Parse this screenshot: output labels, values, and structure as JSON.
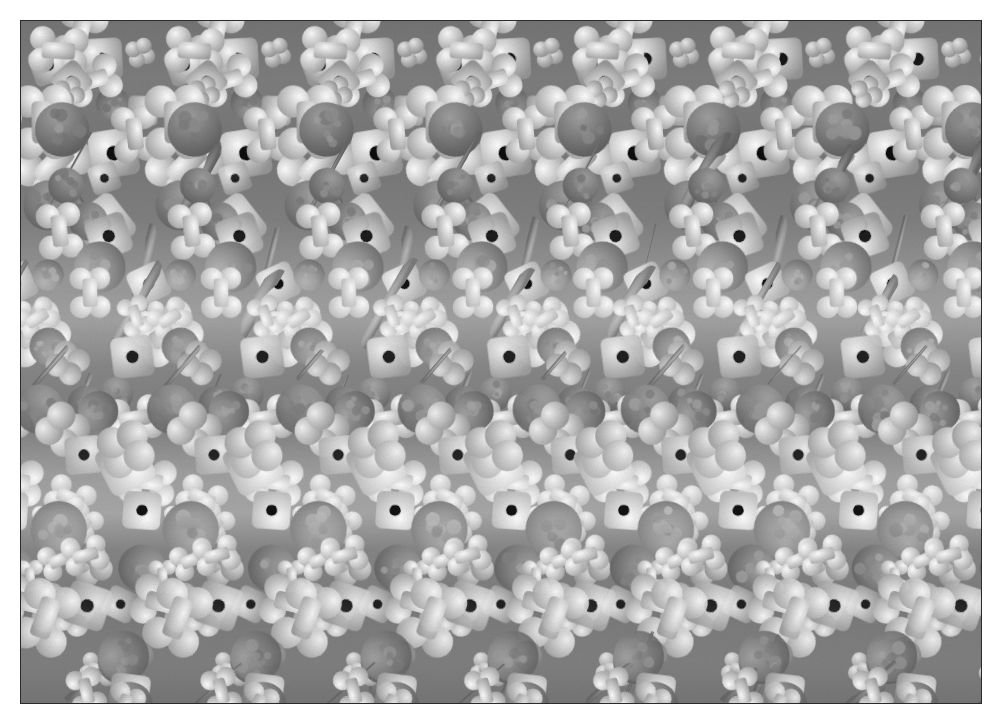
{
  "image": {
    "title": "Autostereogram",
    "kind": "single-image-random-dot-stereogram",
    "canvas_width": 1003,
    "canvas_height": 725,
    "margin_color": "#ffffff",
    "plate": {
      "x": 21,
      "y": 21,
      "width": 960,
      "height": 682,
      "border_color": "#2b2b2b",
      "colorspace": "grayscale"
    },
    "tiling": {
      "repeat_axis": "horizontal",
      "base_period_px": 120,
      "repeats_across": 8,
      "period_min_px": 108,
      "period_max_px": 136,
      "cell_height_px": 46,
      "rows": 16
    },
    "palette": {
      "black": "#0d0d0d",
      "shadow": "#3a3a3a",
      "dark_gray": "#5e5e5e",
      "mid_gray": "#868686",
      "ball_gray": "#909090",
      "rod_gray": "#9c9c9c",
      "light_gray": "#c8c8c8",
      "near_white": "#ececec",
      "white": "#f7f7f7",
      "background": "#7a7a7a"
    },
    "motifs": [
      {
        "name": "bone",
        "label": "dog-bone shape",
        "fill": "#f4f4f4",
        "weight": 30
      },
      {
        "name": "square-hole",
        "label": "square tile with hole",
        "fill": "#e4e4e4",
        "weight": 18
      },
      {
        "name": "ball",
        "label": "round kibble ball",
        "fill": "#8e8e8e",
        "weight": 26
      },
      {
        "name": "rod",
        "label": "curved rod / tube",
        "fill": "#9a9a9a",
        "weight": 16
      },
      {
        "name": "clover",
        "label": "clover / lobed blob",
        "fill": "#d8d8d8",
        "weight": 10
      }
    ],
    "brightness_bands": [
      {
        "y": 0,
        "level": 0.46
      },
      {
        "y": 60,
        "level": 0.52
      },
      {
        "y": 130,
        "level": 0.48
      },
      {
        "y": 200,
        "level": 0.54
      },
      {
        "y": 262,
        "level": 0.74
      },
      {
        "y": 300,
        "level": 0.8
      },
      {
        "y": 345,
        "level": 0.6
      },
      {
        "y": 400,
        "level": 0.52
      },
      {
        "y": 452,
        "level": 0.78
      },
      {
        "y": 492,
        "level": 0.84
      },
      {
        "y": 530,
        "level": 0.58
      },
      {
        "y": 590,
        "level": 0.5
      },
      {
        "y": 640,
        "level": 0.54
      },
      {
        "y": 682,
        "level": 0.47
      }
    ],
    "depth_map": {
      "description": "horizontal period modulation encoding the hidden 3-D relief",
      "rows": [
        [
          0,
          0,
          0,
          0,
          0,
          0,
          0,
          0,
          0,
          0,
          0,
          0
        ],
        [
          0,
          0,
          1,
          1,
          1,
          1,
          1,
          1,
          1,
          1,
          0,
          0
        ],
        [
          0,
          1,
          1,
          2,
          2,
          2,
          2,
          2,
          2,
          1,
          1,
          0
        ],
        [
          0,
          1,
          2,
          2,
          3,
          3,
          3,
          3,
          2,
          2,
          1,
          0
        ],
        [
          0,
          1,
          2,
          3,
          3,
          4,
          4,
          3,
          3,
          2,
          1,
          0
        ],
        [
          0,
          1,
          2,
          3,
          4,
          5,
          5,
          4,
          3,
          2,
          1,
          0
        ],
        [
          0,
          1,
          2,
          3,
          4,
          6,
          6,
          4,
          3,
          2,
          1,
          0
        ],
        [
          0,
          1,
          2,
          3,
          5,
          7,
          7,
          5,
          3,
          2,
          1,
          0
        ],
        [
          0,
          1,
          2,
          4,
          6,
          8,
          8,
          6,
          4,
          2,
          1,
          0
        ],
        [
          0,
          1,
          3,
          4,
          6,
          8,
          8,
          6,
          4,
          3,
          1,
          0
        ],
        [
          0,
          1,
          2,
          4,
          6,
          7,
          7,
          6,
          4,
          2,
          1,
          0
        ],
        [
          0,
          1,
          2,
          3,
          5,
          6,
          6,
          5,
          3,
          2,
          1,
          0
        ],
        [
          0,
          1,
          2,
          3,
          4,
          5,
          5,
          4,
          3,
          2,
          1,
          0
        ],
        [
          0,
          1,
          1,
          2,
          3,
          3,
          3,
          3,
          2,
          1,
          1,
          0
        ],
        [
          0,
          0,
          1,
          1,
          2,
          2,
          2,
          2,
          1,
          1,
          0,
          0
        ],
        [
          0,
          0,
          0,
          0,
          0,
          0,
          0,
          0,
          0,
          0,
          0,
          0
        ]
      ]
    }
  }
}
